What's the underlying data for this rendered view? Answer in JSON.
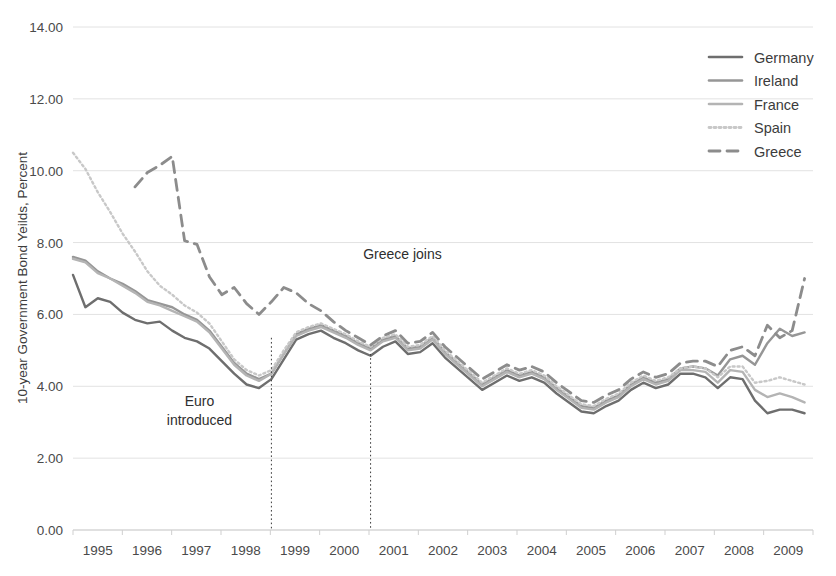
{
  "chart_data": {
    "type": "line",
    "title": "",
    "xlabel": "",
    "ylabel": "10-year Government Bond Yeilds, Percent",
    "ylim": [
      0,
      14
    ],
    "yticks": [
      "0.00",
      "2.00",
      "4.00",
      "6.00",
      "8.00",
      "10.00",
      "12.00",
      "14.00"
    ],
    "ytick_values": [
      0,
      2,
      4,
      6,
      8,
      10,
      12,
      14
    ],
    "xlim": [
      1995,
      2009.92
    ],
    "xticks": [
      "1995",
      "1996",
      "1997",
      "1998",
      "1999",
      "2000",
      "2001",
      "2002",
      "2003",
      "2004",
      "2005",
      "2006",
      "2007",
      "2008",
      "2009"
    ],
    "xtick_values": [
      1995,
      1996,
      1997,
      1998,
      1999,
      2000,
      2001,
      2002,
      2003,
      2004,
      2005,
      2006,
      2007,
      2008,
      2009
    ],
    "grid": "horizontal",
    "legend_position": "top-right",
    "annotations": [
      {
        "id": "euro-introduced",
        "text_line1": "Euro",
        "text_line2": "introduced",
        "x_value": 1999,
        "label_x": 1997.55,
        "label_y": 3.45
      },
      {
        "id": "greece-joins",
        "text_line1": "Greece joins",
        "text_line2": "",
        "x_value": 2001,
        "label_x": 2000.85,
        "label_y": 7.55
      }
    ],
    "event_lines": [
      {
        "name": "euro-introduced",
        "x_value": 1999,
        "y_top": 5.35,
        "y_bottom": 0
      },
      {
        "name": "greece-joins",
        "x_value": 2001,
        "y_top": 4.9,
        "y_bottom": 0
      }
    ],
    "x": [
      1995.0,
      1995.25,
      1995.5,
      1995.75,
      1996.0,
      1996.25,
      1996.5,
      1996.75,
      1997.0,
      1997.25,
      1997.5,
      1997.75,
      1998.0,
      1998.25,
      1998.5,
      1998.75,
      1999.0,
      1999.25,
      1999.5,
      1999.75,
      2000.0,
      2000.25,
      2000.5,
      2000.75,
      2001.0,
      2001.25,
      2001.5,
      2001.75,
      2002.0,
      2002.25,
      2002.5,
      2002.75,
      2003.0,
      2003.25,
      2003.5,
      2003.75,
      2004.0,
      2004.25,
      2004.5,
      2004.75,
      2005.0,
      2005.25,
      2005.5,
      2005.75,
      2006.0,
      2006.25,
      2006.5,
      2006.75,
      2007.0,
      2007.25,
      2007.5,
      2007.75,
      2008.0,
      2008.25,
      2008.5,
      2008.75,
      2009.0,
      2009.25,
      2009.5,
      2009.75
    ],
    "series": [
      {
        "name": "Germany",
        "color": "#6e6e6e",
        "dash": "none",
        "width": 2.4,
        "values": [
          7.1,
          6.2,
          6.45,
          6.35,
          6.05,
          5.85,
          5.75,
          5.8,
          5.55,
          5.35,
          5.25,
          5.05,
          4.7,
          4.35,
          4.05,
          3.95,
          4.2,
          4.75,
          5.3,
          5.45,
          5.55,
          5.35,
          5.2,
          5.0,
          4.85,
          5.1,
          5.25,
          4.9,
          4.95,
          5.2,
          4.8,
          4.5,
          4.2,
          3.9,
          4.1,
          4.3,
          4.15,
          4.25,
          4.1,
          3.8,
          3.55,
          3.3,
          3.25,
          3.45,
          3.6,
          3.9,
          4.1,
          3.95,
          4.05,
          4.35,
          4.35,
          4.25,
          3.95,
          4.25,
          4.2,
          3.6,
          3.25,
          3.35,
          3.35,
          3.25
        ]
      },
      {
        "name": "Ireland",
        "color": "#969696",
        "dash": "none",
        "width": 2.4,
        "values": [
          7.6,
          7.5,
          7.2,
          7.0,
          6.85,
          6.65,
          6.4,
          6.3,
          6.2,
          6.0,
          5.85,
          5.55,
          5.1,
          4.65,
          4.35,
          4.2,
          4.35,
          4.9,
          5.45,
          5.6,
          5.7,
          5.55,
          5.4,
          5.2,
          5.05,
          5.3,
          5.4,
          5.05,
          5.1,
          5.35,
          4.95,
          4.65,
          4.35,
          4.05,
          4.25,
          4.45,
          4.3,
          4.4,
          4.25,
          3.95,
          3.7,
          3.45,
          3.4,
          3.6,
          3.75,
          4.05,
          4.25,
          4.1,
          4.2,
          4.5,
          4.55,
          4.5,
          4.3,
          4.75,
          4.85,
          4.6,
          5.2,
          5.6,
          5.4,
          5.5
        ]
      },
      {
        "name": "France",
        "color": "#b4b4b4",
        "dash": "none",
        "width": 2.4,
        "values": [
          7.55,
          7.45,
          7.15,
          7.0,
          6.8,
          6.6,
          6.35,
          6.25,
          6.1,
          5.95,
          5.8,
          5.5,
          5.05,
          4.6,
          4.3,
          4.15,
          4.35,
          4.9,
          5.4,
          5.55,
          5.65,
          5.5,
          5.35,
          5.15,
          5.0,
          5.25,
          5.35,
          5.0,
          5.05,
          5.3,
          4.9,
          4.6,
          4.3,
          4.0,
          4.2,
          4.4,
          4.25,
          4.35,
          4.2,
          3.9,
          3.65,
          3.4,
          3.35,
          3.55,
          3.7,
          4.0,
          4.2,
          4.05,
          4.15,
          4.45,
          4.45,
          4.4,
          4.1,
          4.45,
          4.4,
          3.9,
          3.7,
          3.8,
          3.7,
          3.55
        ]
      },
      {
        "name": "Spain",
        "color": "#c8c8c8",
        "dash": "2 3",
        "width": 2.4,
        "values": [
          10.5,
          10.05,
          9.4,
          8.85,
          8.25,
          7.75,
          7.2,
          6.8,
          6.55,
          6.25,
          6.05,
          5.75,
          5.25,
          4.75,
          4.45,
          4.3,
          4.45,
          5.0,
          5.5,
          5.65,
          5.75,
          5.6,
          5.45,
          5.25,
          5.1,
          5.35,
          5.45,
          5.1,
          5.15,
          5.4,
          5.0,
          4.7,
          4.4,
          4.1,
          4.3,
          4.5,
          4.35,
          4.45,
          4.3,
          4.0,
          3.75,
          3.5,
          3.45,
          3.65,
          3.8,
          4.1,
          4.3,
          4.15,
          4.25,
          4.5,
          4.55,
          4.5,
          4.25,
          4.55,
          4.55,
          4.1,
          4.15,
          4.25,
          4.15,
          4.05
        ]
      },
      {
        "name": "Greece",
        "color": "#8c8c8c",
        "dash": "11 7",
        "width": 2.8,
        "values": [
          null,
          null,
          null,
          null,
          null,
          9.55,
          9.95,
          10.15,
          10.4,
          8.05,
          7.95,
          7.05,
          6.55,
          6.75,
          6.3,
          6.0,
          6.35,
          6.75,
          6.6,
          6.3,
          6.1,
          5.8,
          5.55,
          5.35,
          5.15,
          5.4,
          5.55,
          5.2,
          5.25,
          5.5,
          5.1,
          4.8,
          4.5,
          4.2,
          4.4,
          4.6,
          4.45,
          4.55,
          4.4,
          4.1,
          3.85,
          3.6,
          3.55,
          3.75,
          3.9,
          4.2,
          4.4,
          4.25,
          4.35,
          4.65,
          4.7,
          4.7,
          4.55,
          5.0,
          5.1,
          4.85,
          5.7,
          5.35,
          5.55,
          7.0
        ]
      }
    ],
    "legend": [
      {
        "label": "Germany",
        "color": "#6e6e6e",
        "dash": "none"
      },
      {
        "label": "Ireland",
        "color": "#969696",
        "dash": "none"
      },
      {
        "label": "France",
        "color": "#b4b4b4",
        "dash": "none"
      },
      {
        "label": "Spain",
        "color": "#c8c8c8",
        "dash": "2 3"
      },
      {
        "label": "Greece",
        "color": "#8c8c8c",
        "dash": "11 7"
      }
    ]
  }
}
